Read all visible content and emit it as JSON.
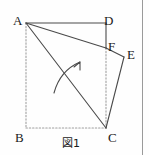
{
  "figure": {
    "caption": "図1",
    "vertices": [
      {
        "id": "A",
        "label": "A",
        "x": 26,
        "y": 23,
        "label_x": 13,
        "label_y": 14
      },
      {
        "id": "B",
        "label": "B",
        "x": 26,
        "y": 128,
        "label_x": 15,
        "label_y": 131
      },
      {
        "id": "C",
        "label": "C",
        "x": 106,
        "y": 128,
        "label_x": 108,
        "label_y": 131
      },
      {
        "id": "D",
        "label": "D",
        "x": 106,
        "y": 23,
        "label_x": 104,
        "label_y": 14
      },
      {
        "id": "E",
        "label": "E",
        "x": 124,
        "y": 57,
        "label_x": 127,
        "label_y": 48
      },
      {
        "id": "F",
        "label": "F",
        "x": 106,
        "y": 48,
        "label_x": 108,
        "label_y": 40
      }
    ],
    "solid_edges": [
      {
        "name": "edge-AD",
        "from": "A",
        "to": "D"
      },
      {
        "name": "edge-DF",
        "from": "D",
        "to": "F"
      },
      {
        "name": "edge-AF",
        "from": "A",
        "to": "F"
      },
      {
        "name": "edge-FE",
        "from": "F",
        "to": "E"
      },
      {
        "name": "edge-EC",
        "from": "E",
        "to": "C"
      },
      {
        "name": "edge-AC",
        "from": "A",
        "to": "C"
      }
    ],
    "dotted_edges": [
      {
        "name": "edge-AB",
        "from": "A",
        "to": "B"
      },
      {
        "name": "edge-BC",
        "from": "B",
        "to": "C"
      },
      {
        "name": "edge-FC",
        "from": "F",
        "to": "C"
      }
    ],
    "arrow": {
      "name": "fold-direction-arrow",
      "path": "M 54 93 C 58 78, 66 68, 80 62",
      "head": "M 80 62 L 74 66 M 80 62 L 80 69"
    },
    "caption_pos": {
      "x": 62,
      "y": 138
    },
    "frame_rule_x": 142,
    "colors": {
      "stroke": "#4a4a4a",
      "dotted": "#9e9e9e",
      "text": "#1a1a1a",
      "background": "#fefefe",
      "frame": "#9a9a9a"
    }
  }
}
